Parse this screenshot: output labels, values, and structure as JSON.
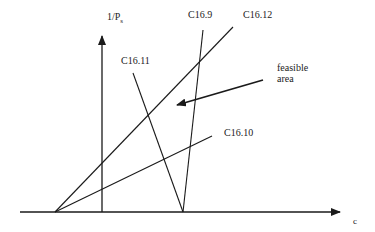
{
  "axes": {
    "y_label": "1/P",
    "y_label_sub": "s",
    "x_label": "c"
  },
  "constraints": [
    {
      "id": "C16.9",
      "label": "C16.9",
      "from": [
        183,
        212
      ],
      "to": [
        203,
        30
      ]
    },
    {
      "id": "C16.12",
      "label": "C16.12",
      "from": [
        55,
        212
      ],
      "to": [
        233,
        27
      ]
    },
    {
      "id": "C16.11",
      "label": "C16.11",
      "from": [
        133,
        73
      ],
      "to": [
        183,
        212
      ]
    },
    {
      "id": "C16.10",
      "label": "C16.10",
      "from": [
        55,
        212
      ],
      "to": [
        212,
        136
      ]
    }
  ],
  "annotation": {
    "line1": "feasible",
    "line2": "area",
    "arrow_from": [
      263,
      80
    ],
    "arrow_to": [
      175,
      106
    ]
  },
  "colors": {
    "line": "#1a1a1a",
    "background": "#ffffff"
  }
}
